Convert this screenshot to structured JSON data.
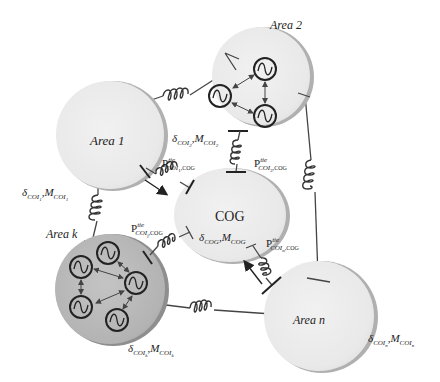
{
  "diagram": {
    "type": "power-system center-of-inertia network",
    "colors": {
      "area_fill": "#ebebeb",
      "area_shadow": "#a9a9a9",
      "area_k_fill": "#b8b8b8",
      "cog_fill": "#ebebeb",
      "line": "#444444",
      "text": "#222222"
    },
    "nodes": {
      "area1": {
        "label": "Area 1",
        "params": "δCOI1,MCOI1"
      },
      "area2": {
        "label": "Area 2",
        "params": "δCOI2,MCOI2",
        "generators": 3
      },
      "areak": {
        "label": "Area k",
        "params": "δCOIk,MCOIk",
        "generators": 5
      },
      "arean": {
        "label": "Area n",
        "params": "δCOIn,MCOIn"
      },
      "cog": {
        "label": "COG",
        "params": "δCOG,MCOG"
      }
    },
    "labels": {
      "area1": "Area 1",
      "area2": "Area 2",
      "areak": "Area k",
      "arean": "Area n",
      "cog": "COG",
      "delta": "δ",
      "M": "M",
      "comma": ",",
      "sub_coi": "COI",
      "sub_cog": "COG",
      "idx1": "1",
      "idx2": "2",
      "idxk": "k",
      "idxn": "n",
      "idxj": "j",
      "P": "P",
      "tie": "tie",
      "sub_coi1_cog": "COI",
      "tie_suffix": ",COG"
    },
    "tie_flows": [
      {
        "from": "Area 1",
        "to": "COG",
        "label": "P^tie_{COI1,COG}",
        "arrow": "toward COG"
      },
      {
        "from": "Area 2",
        "to": "COG",
        "label": "P^tie_{COI2,COG}"
      },
      {
        "from": "Area k",
        "to": "COG",
        "label": "P^tie_{COIj,COG}"
      },
      {
        "from": "Area n",
        "to": "COG",
        "label": "P^tie_{COIn,COG}",
        "arrow": "toward COG"
      }
    ],
    "inter_area_links": [
      {
        "from": "Area 1",
        "to": "Area 2"
      },
      {
        "from": "Area 1",
        "to": "Area k"
      },
      {
        "from": "Area 2",
        "to": "Area n"
      },
      {
        "from": "Area k",
        "to": "Area n"
      }
    ]
  }
}
